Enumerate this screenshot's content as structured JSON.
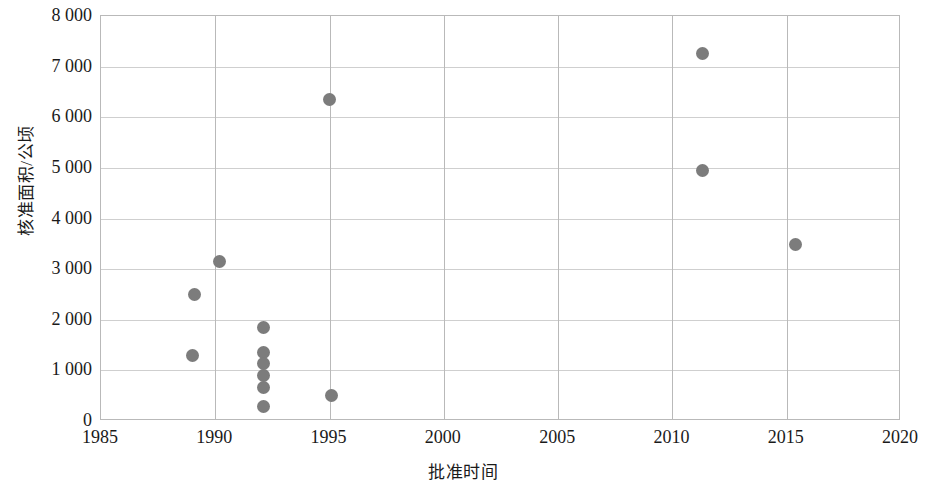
{
  "chart_data": {
    "type": "scatter",
    "title": "",
    "xlabel": "批准时间",
    "ylabel": "核准面积/公顷",
    "xlim": [
      1985,
      2020
    ],
    "ylim": [
      0,
      8000
    ],
    "xticks": [
      "1985",
      "1990",
      "1995",
      "2000",
      "2005",
      "2010",
      "2015",
      "2020"
    ],
    "xtick_values": [
      1985,
      1990,
      1995,
      2000,
      2005,
      2010,
      2015,
      2020
    ],
    "yticks": [
      "0",
      "1 000",
      "2 000",
      "3 000",
      "4 000",
      "5 000",
      "6 000",
      "7 000",
      "8 000"
    ],
    "ytick_values": [
      0,
      1000,
      2000,
      3000,
      4000,
      5000,
      6000,
      7000,
      8000
    ],
    "grid": "both",
    "legend": "none",
    "marker_color": "#7c7c7c",
    "axis_color": "#b9b9b9",
    "gridline_color": "#cfcfcf",
    "series": [
      {
        "name": "核准面积",
        "points": [
          {
            "x": 1989.0,
            "y": 1300
          },
          {
            "x": 1989.1,
            "y": 2500
          },
          {
            "x": 1990.2,
            "y": 3150
          },
          {
            "x": 1992.1,
            "y": 1850
          },
          {
            "x": 1992.1,
            "y": 1350
          },
          {
            "x": 1992.1,
            "y": 1130
          },
          {
            "x": 1992.1,
            "y": 900
          },
          {
            "x": 1992.1,
            "y": 670
          },
          {
            "x": 1992.1,
            "y": 280
          },
          {
            "x": 1995.0,
            "y": 6360
          },
          {
            "x": 1995.1,
            "y": 500
          },
          {
            "x": 2011.3,
            "y": 7250
          },
          {
            "x": 2011.3,
            "y": 4950
          },
          {
            "x": 2015.4,
            "y": 3480
          }
        ]
      }
    ]
  }
}
